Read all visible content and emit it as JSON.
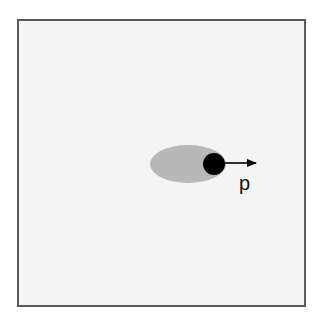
{
  "diagram": {
    "frame": {
      "background": "#f4f4f4",
      "border_color": "#5a5a5a"
    },
    "ellipse": {
      "cx": 188,
      "cy": 164,
      "rx": 38,
      "ry": 19,
      "color": "#b8b8b8"
    },
    "particle": {
      "cx": 214,
      "cy": 164,
      "r": 11,
      "color": "#000000"
    },
    "vector": {
      "x1": 225,
      "y1": 163,
      "x2": 256,
      "y2": 163,
      "color": "#000000"
    },
    "label": {
      "text": "p",
      "x": 239,
      "y": 190
    }
  }
}
